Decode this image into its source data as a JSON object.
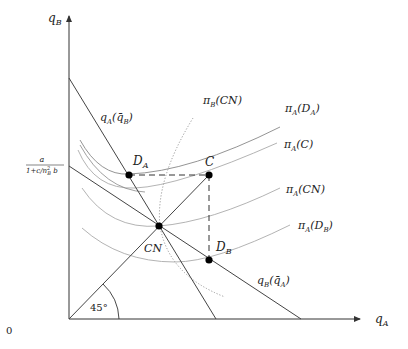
{
  "diagram": {
    "axes": {
      "x_label": "q",
      "x_label_sub": "A",
      "y_label": "q",
      "y_label_sub": "B",
      "origin_label": "0",
      "y_tick_label_numerator": "a",
      "y_tick_label_denominator": "1+c/n",
      "y_tick_label_denominator_sup": "2",
      "y_tick_label_denominator_sub": "B",
      "y_tick_label_denominator_tail": " b"
    },
    "angle_label": "45°",
    "lines": {
      "reaction_A": {
        "label_main": "q",
        "label_sub": "A",
        "label_arg": "(q̄",
        "label_arg_sub": "B",
        "label_close": ")"
      },
      "reaction_B": {
        "label_main": "q",
        "label_sub": "B",
        "label_arg": "(q̄",
        "label_arg_sub": "A",
        "label_close": ")"
      }
    },
    "points": {
      "DA": {
        "label": "D",
        "sub": "A"
      },
      "C": {
        "label": "C",
        "sub": ""
      },
      "CN": {
        "label": "CN",
        "sub": ""
      },
      "DB": {
        "label": "D",
        "sub": "B"
      }
    },
    "curves": {
      "piB_CN": {
        "label": "π",
        "sub": "B",
        "arg": "(CN)"
      },
      "piA_DA": {
        "label": "π",
        "sub": "A",
        "arg": "(D",
        "arg_sub": "A",
        "close": ")"
      },
      "piA_C": {
        "label": "π",
        "sub": "A",
        "arg": "(C)"
      },
      "piA_CN": {
        "label": "π",
        "sub": "A",
        "arg": "(CN)"
      },
      "piA_DB": {
        "label": "π",
        "sub": "A",
        "arg": "(D",
        "arg_sub": "B",
        "close": ")"
      }
    },
    "colors": {
      "axis": "#333333",
      "line": "#444444",
      "curve": "#aaaaaa",
      "dotted": "#999999",
      "point": "#000000"
    }
  }
}
